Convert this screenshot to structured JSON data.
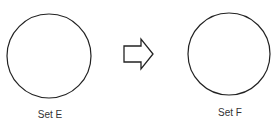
{
  "diagram": {
    "sets": [
      {
        "label": "Set E",
        "cx": 49,
        "cy": 56,
        "r": 42
      },
      {
        "label": "Set F",
        "cx": 229,
        "cy": 54,
        "r": 41
      }
    ],
    "arrow": {
      "direction": "right"
    },
    "colors": {
      "stroke": "#222222",
      "background": "#ffffff",
      "text": "#333333"
    }
  }
}
